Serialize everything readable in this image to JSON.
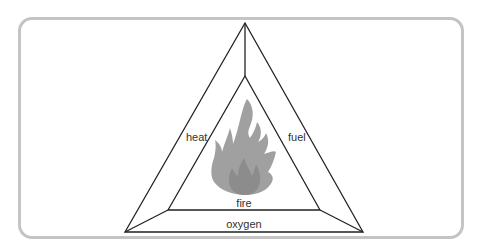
{
  "diagram": {
    "labels": {
      "left_side": "heat",
      "right_side": "fuel",
      "bottom_side": "oxygen",
      "center": "fire"
    },
    "center_icon": "flame-icon",
    "colors": {
      "frame": "#c4c4c4",
      "lines": "#222222",
      "flame_outer": "#9e9e9e",
      "flame_inner": "#8a8a8a",
      "text": "#333333"
    }
  }
}
